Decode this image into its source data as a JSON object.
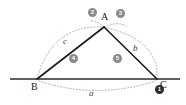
{
  "figure": {
    "type": "geometry-construction",
    "width": 186,
    "height": 105,
    "background": "#ffffff"
  },
  "colors": {
    "line": "#1a1a1a",
    "baseline": "#2b2b2b",
    "arc": "#b0b0b0",
    "step_marker": "#8a8a8a",
    "step_marker_dark": "#2b2b2b",
    "label": "#1a1a1a",
    "side_label": "#3a3a3a"
  },
  "vertices": [
    {
      "name": "A",
      "label": "A",
      "x": 104,
      "y": 27
    },
    {
      "name": "B",
      "label": "B",
      "x": 37,
      "y": 79
    },
    {
      "name": "C",
      "label": "C",
      "x": 157,
      "y": 79
    }
  ],
  "vertex_labels": [
    {
      "id": "label-A",
      "text": "A",
      "x": 101,
      "y": 12
    },
    {
      "id": "label-B",
      "text": "B",
      "x": 31,
      "y": 82
    },
    {
      "id": "label-C",
      "text": "C",
      "x": 160,
      "y": 80
    }
  ],
  "sides": [
    {
      "name": "side-a",
      "label": "a",
      "from": "B",
      "to": "C",
      "label_x": 89,
      "label_y": 89
    },
    {
      "name": "side-b",
      "label": "b",
      "from": "A",
      "to": "C",
      "label_x": 133,
      "label_y": 44
    },
    {
      "name": "side-c",
      "label": "c",
      "from": "A",
      "to": "B",
      "label_x": 63,
      "label_y": 37
    }
  ],
  "steps": [
    {
      "id": "step-1",
      "number": "1",
      "x": 155,
      "y": 85,
      "style": "dark",
      "description": "mark point C on baseline"
    },
    {
      "id": "step-2",
      "number": "2",
      "x": 88,
      "y": 8,
      "style": "light",
      "description": "arc of radius c from B"
    },
    {
      "id": "step-3",
      "number": "3",
      "x": 116,
      "y": 9,
      "style": "light",
      "description": "arc of radius b from C"
    },
    {
      "id": "step-4",
      "number": "4",
      "x": 69,
      "y": 54,
      "style": "light",
      "description": "draw segment AB"
    },
    {
      "id": "step-5",
      "number": "5",
      "x": 113,
      "y": 54,
      "style": "light",
      "description": "draw segment AC"
    }
  ],
  "baseline": {
    "name": "baseline",
    "x1": 10,
    "y1": 79,
    "x2": 180,
    "y2": 79
  },
  "arcs": [
    {
      "name": "arc-from-B",
      "description": "dotted arc radius c centered at B"
    },
    {
      "name": "arc-from-C",
      "description": "dotted arc radius b centered at C"
    },
    {
      "name": "arc-base",
      "description": "dotted arc below baseline spanning B to C"
    }
  ]
}
